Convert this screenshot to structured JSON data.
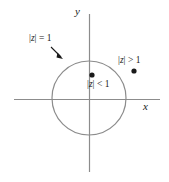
{
  "figure": {
    "width": 169,
    "height": 182,
    "background_color": "#ffffff",
    "line_color": "#8c8c8c",
    "text_color": "#1a1a1a",
    "dot_color": "#1a1a1a"
  },
  "axes": {
    "x_label": "x",
    "y_label": "y",
    "origin": {
      "x": 89,
      "y": 99
    },
    "x_axis": {
      "start_x": 14,
      "end_x": 160,
      "y": 99
    },
    "y_axis": {
      "x": 89,
      "start_y": 14,
      "end_y": 172
    }
  },
  "circle": {
    "center_x": 89,
    "center_y": 98,
    "radius": 37,
    "label": "|z| = 1",
    "label_parts": {
      "bar_open": "|",
      "var": "z",
      "bar_close": "|",
      "relation": "=",
      "value": "1"
    }
  },
  "annotations": {
    "outside_point": {
      "label": "|z| > 1",
      "label_parts": {
        "bar_open": "|",
        "var": "z",
        "bar_close": "|",
        "relation": ">",
        "value": "1"
      },
      "dot_x": 134,
      "dot_y": 71
    },
    "inside_point": {
      "label": "|z| < 1",
      "label_parts": {
        "bar_open": "|",
        "var": "z",
        "bar_close": "|",
        "relation": "<",
        "value": "1"
      },
      "dot_x": 92,
      "dot_y": 75
    },
    "arrow": {
      "from_x": 51,
      "from_y": 47,
      "to_x": 63,
      "to_y": 59
    }
  }
}
